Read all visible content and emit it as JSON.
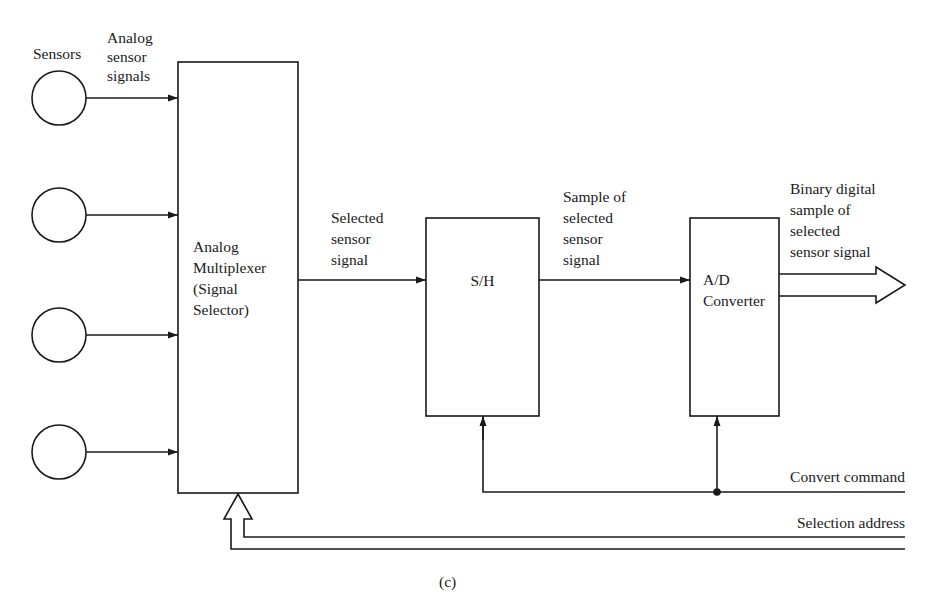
{
  "colors": {
    "ink": "#1a1a1a",
    "background": "#ffffff"
  },
  "labels": {
    "sensors": "Sensors",
    "analog_signals": [
      "Analog",
      "sensor",
      "signals"
    ],
    "selected_signal": [
      "Selected",
      "sensor",
      "signal"
    ],
    "sample_signal": [
      "Sample of",
      "selected",
      "sensor",
      "signal"
    ],
    "binary_output": [
      "Binary digital",
      "sample of",
      "selected",
      "sensor signal"
    ],
    "convert_command": "Convert command",
    "selection_address": "Selection address",
    "caption": "(c)"
  },
  "blocks": {
    "multiplexer": [
      "Analog",
      "Multiplexer",
      "(Signal",
      "Selector)"
    ],
    "sample_hold": "S/H",
    "adc": [
      "A/D",
      "Converter"
    ]
  },
  "sensors": [
    {
      "id": "sensor-1"
    },
    {
      "id": "sensor-2"
    },
    {
      "id": "sensor-3"
    },
    {
      "id": "sensor-4"
    }
  ]
}
